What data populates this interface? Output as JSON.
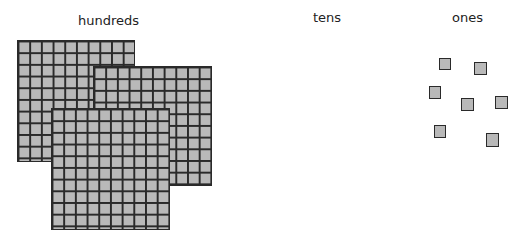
{
  "labels": {
    "hundreds": "hundreds",
    "tens": "tens",
    "ones": "ones"
  },
  "colors": {
    "block_fill": "#b9b9b9",
    "block_line": "#2a2a2a"
  },
  "hundreds": {
    "count": 3,
    "grid_size": "10x10"
  },
  "tens": {
    "count": 0
  },
  "ones": {
    "count": 7
  }
}
